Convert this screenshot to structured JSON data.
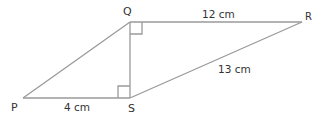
{
  "diagram": {
    "type": "geometry",
    "line_color": "#9a9a9a",
    "text_color": "#333333",
    "points": {
      "P": {
        "label": "P",
        "x": 23,
        "y": 98
      },
      "Q": {
        "label": "Q",
        "x": 130,
        "y": 22
      },
      "R": {
        "label": "R",
        "x": 302,
        "y": 22
      },
      "S": {
        "label": "S",
        "x": 130,
        "y": 98
      }
    },
    "segments": [
      {
        "from": "P",
        "to": "Q"
      },
      {
        "from": "Q",
        "to": "R",
        "length": "12 cm"
      },
      {
        "from": "R",
        "to": "S",
        "length": "13 cm"
      },
      {
        "from": "S",
        "to": "P",
        "length": "4 cm"
      },
      {
        "from": "Q",
        "to": "S"
      }
    ],
    "right_angles": [
      "Q",
      "S"
    ],
    "labels": {
      "P": "P",
      "Q": "Q",
      "R": "R",
      "S": "S",
      "QR": "12 cm",
      "RS": "13 cm",
      "PS": "4 cm"
    }
  }
}
